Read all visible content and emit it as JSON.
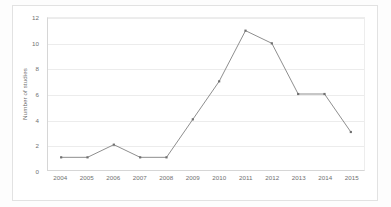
{
  "chart_data": {
    "type": "line",
    "title": "",
    "xlabel": "",
    "ylabel": "Number of studies",
    "categories": [
      "2004",
      "2005",
      "2006",
      "2007",
      "2008",
      "2009",
      "2010",
      "2011",
      "2012",
      "2013",
      "2014",
      "2015"
    ],
    "values": [
      1,
      1,
      2,
      1,
      1,
      4,
      7,
      11,
      10,
      6,
      6,
      3
    ],
    "series": [
      {
        "name": "Number of studies",
        "values": [
          1,
          1,
          2,
          1,
          1,
          4,
          7,
          11,
          10,
          6,
          6,
          3
        ]
      }
    ],
    "ylim": [
      0,
      12
    ],
    "yticks": [
      0,
      2,
      4,
      6,
      8,
      10,
      12
    ],
    "ytick_labels": [
      "0",
      "2",
      "4",
      "6",
      "8",
      "10",
      "12"
    ],
    "xtick_labels": [
      "2004",
      "2005",
      "2006",
      "2007",
      "2008",
      "2009",
      "2010",
      "2011",
      "2012",
      "2013",
      "2014",
      "2015"
    ],
    "grid": "horizontal",
    "legend": "none",
    "marker": "square",
    "line_color": "#808080",
    "marker_color": "#707070",
    "gridline_color": "#ececec",
    "axis_color": "#d6d6d6",
    "tick_label_color": "#6f6f6f",
    "background_color": "#ffffff"
  }
}
